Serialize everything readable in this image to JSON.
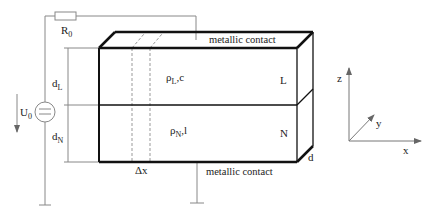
{
  "diagram": {
    "labels": {
      "resistor": "R",
      "resistor_sub": "0",
      "voltage": "U",
      "voltage_sub": "0",
      "d_L": "d",
      "d_L_sub": "L",
      "d_N": "d",
      "d_N_sub": "N",
      "top_contact": "metallic contact",
      "bottom_contact": "metallic contact",
      "layer_L_param": "ρ",
      "layer_L_sub": "L",
      "layer_L_suffix": ",c",
      "layer_N_param": "ρ",
      "layer_N_sub": "N",
      "layer_N_suffix": ",l",
      "layer_L": "L",
      "layer_N": "N",
      "depth": "d",
      "delta_x": "Δx",
      "axis_x": "x",
      "axis_y": "y",
      "axis_z": "z"
    },
    "colors": {
      "thick_line": "#111111",
      "thin_line": "#777777",
      "dashed": "#999999"
    }
  }
}
